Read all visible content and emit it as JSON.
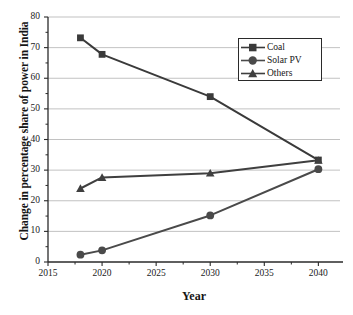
{
  "chart_data": {
    "type": "line",
    "title": "",
    "xlabel": "Year",
    "ylabel": "Change in percentage share of power in India",
    "xlim": [
      2015,
      2042
    ],
    "ylim": [
      0,
      80
    ],
    "xticks": [
      2015,
      2020,
      2025,
      2030,
      2035,
      2040
    ],
    "yticks": [
      0,
      10,
      20,
      30,
      40,
      50,
      60,
      70,
      80
    ],
    "grid": true,
    "legend_position": "top-right",
    "series": [
      {
        "name": "Coal",
        "marker": "square",
        "color": "#3a3a3a",
        "x": [
          2018,
          2020,
          2030,
          2040
        ],
        "values": [
          73.2,
          67.8,
          54.0,
          33.3
        ]
      },
      {
        "name": "Solar PV",
        "marker": "circle",
        "color": "#4a4a4a",
        "x": [
          2018,
          2020,
          2030,
          2040
        ],
        "values": [
          2.4,
          3.8,
          15.2,
          30.3
        ]
      },
      {
        "name": "Others",
        "marker": "triangle",
        "color": "#3f3f3f",
        "x": [
          2018,
          2020,
          2030,
          2040
        ],
        "values": [
          24.0,
          27.6,
          29.0,
          33.2
        ]
      }
    ]
  },
  "axis": {
    "x_tick_labels": [
      "2015",
      "2020",
      "2025",
      "2030",
      "2035",
      "2040"
    ],
    "y_tick_labels": [
      "0",
      "10",
      "20",
      "30",
      "40",
      "50",
      "60",
      "70",
      "80"
    ],
    "x_title": "Year",
    "y_title": "Change in percentage share of power in India"
  },
  "legend": {
    "entries": [
      {
        "label": "Coal",
        "marker": "square-marker"
      },
      {
        "label": "Solar PV",
        "marker": "circle-marker"
      },
      {
        "label": "Others",
        "marker": "triangle-marker"
      }
    ]
  },
  "colors": {
    "line": "#3a3a3a",
    "grid": "#a8a8a8",
    "axis": "#2a2a2a",
    "background": "#ffffff"
  }
}
